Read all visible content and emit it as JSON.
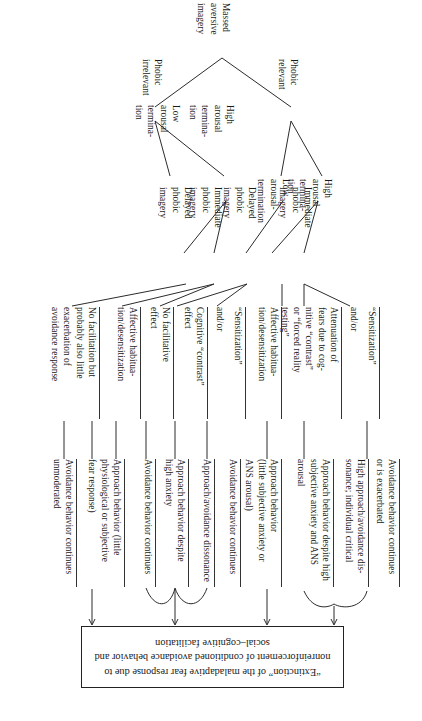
{
  "figure": {
    "type": "flow-diagram",
    "orientation": "printed-rotated-180",
    "title_box": {
      "text": "“Extinction” of the maladaptive fear response due to nonreinforcement of conditioned avoidance behavior and social–cognitive facilitation"
    },
    "root": {
      "label": "Massed\naversive\nimagery"
    },
    "level1": [
      {
        "label": "Phobic\nrelevant"
      },
      {
        "label": "Phobic\nirrelevant"
      }
    ],
    "level2": [
      {
        "label": "High\narousal\ntermina-\ntion"
      },
      {
        "label": "Low\narousal-\ntermination"
      },
      {
        "label": "High\narousal\ntermina-\ntion"
      },
      {
        "label": "Low\narousal\ntermina-\ntion"
      }
    ],
    "level3": [
      {
        "label": "Immediate\nphobic\nimagery"
      },
      {
        "label": "Delayed\nphobic\nimagery"
      },
      {
        "label": "Immediate\nphobic\nimagery"
      },
      {
        "label": "Delayed\nphobic\nimagery"
      }
    ],
    "mechanisms": [
      {
        "label": "“Sensitization”"
      },
      {
        "label": "and/or"
      },
      {
        "label": "Attenuation of\nfears due to cog-\nnitive “contrast”\nor “forced reality\ntesting”"
      },
      {
        "label": "Affective habitua-\ntion/desensitization"
      },
      {
        "label": "“Sensitization”"
      },
      {
        "label": "and/or"
      },
      {
        "label": "Cognitive “contrast”\neffect"
      },
      {
        "label": "No facilitative\neffect"
      },
      {
        "label": "Affective habitua-\ntion/desensitization"
      },
      {
        "label": "No facilitation but\nprobably also little\nexacerbation of\navoidance response"
      }
    ],
    "outcomes": [
      {
        "label": "Avoidance behavior continues\nor is exacerbated"
      },
      {
        "label": "High approach/avoidance dis-\nsonance; individual critical"
      },
      {
        "label": "Approach behavior despite high\nsubjective anxiety and ANS\narousal"
      },
      {
        "label": "Approach behavior\n(little subjective anxiety or\nANS arousal)"
      },
      {
        "label": "Avoidance behavior continues"
      },
      {
        "label": "Approach/avoidance dissonance"
      },
      {
        "label": "Approach behavior despite\nhigh anxiety"
      },
      {
        "label": "Avoidance behavior continues"
      },
      {
        "label": "Approach behavior (little\nphysiological or subjective\nfear response)"
      },
      {
        "label": "Avoidance behavior continues\nunmoderated"
      }
    ],
    "colors": {
      "ink": "#1a1a1a",
      "stroke": "#2b2b2b",
      "background": "#ffffff"
    }
  }
}
